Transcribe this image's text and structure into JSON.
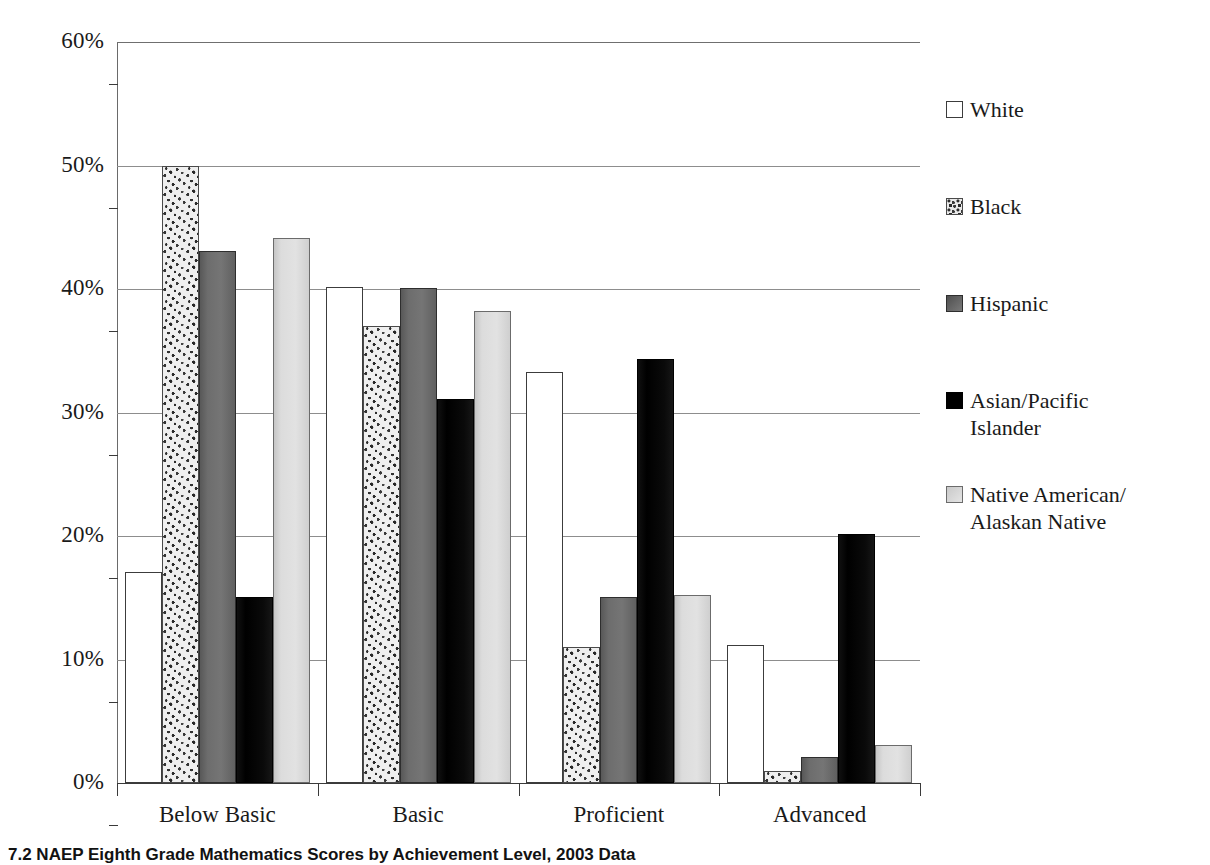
{
  "chart_data": {
    "type": "bar",
    "title": "",
    "caption": "7.2   NAEP Eighth Grade Mathematics Scores by Achievement Level, 2003 Data",
    "categories": [
      "Below Basic",
      "Basic",
      "Proficient",
      "Advanced"
    ],
    "xlabel": "",
    "ylabel": "",
    "ylim": [
      0,
      60
    ],
    "ytick_labels": [
      "0%",
      "10%",
      "20%",
      "30%",
      "40%",
      "50%",
      "60%"
    ],
    "ytick_values": [
      0,
      10,
      20,
      30,
      40,
      50,
      60
    ],
    "grid": true,
    "legend_position": "right",
    "series": [
      {
        "name": "White",
        "swatch": "white",
        "values": [
          17.1,
          40.2,
          33.3,
          11.2
        ]
      },
      {
        "name": "Black",
        "swatch": "speckled",
        "values": [
          50.0,
          37.0,
          11.0,
          1.0
        ]
      },
      {
        "name": "Hispanic",
        "swatch": "darkgray",
        "values": [
          43.1,
          40.1,
          15.1,
          2.1
        ]
      },
      {
        "name": "Asian/Pacific Islander",
        "swatch": "solidblack",
        "values": [
          15.1,
          31.1,
          34.3,
          20.2
        ]
      },
      {
        "name": "Native American/Alaskan Native",
        "swatch": "lightgray",
        "values": [
          44.1,
          38.2,
          15.2,
          3.1
        ]
      }
    ]
  },
  "legend": {
    "items": [
      {
        "label": "White",
        "line2": ""
      },
      {
        "label": "Black",
        "line2": ""
      },
      {
        "label": "Hispanic",
        "line2": ""
      },
      {
        "label": "Asian/Pacific",
        "line2": "Islander"
      },
      {
        "label": "Native American/",
        "line2": "Alaskan Native"
      }
    ]
  },
  "colors": {
    "white": "#ffffff",
    "speckled": "#efefef",
    "darkgray": "#6d6d6d",
    "solidblack": "#000000",
    "lightgray": "#dcdcdc",
    "axis": "#3a3a3a",
    "gridline": "#8d8d8d",
    "text": "#1a1a1a"
  }
}
